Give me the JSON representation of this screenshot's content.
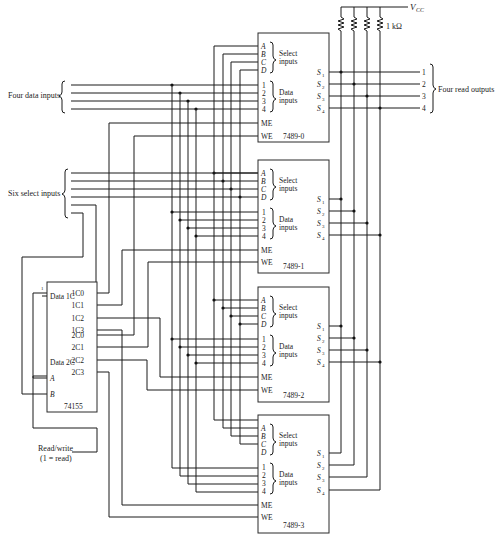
{
  "diagram": {
    "labels": {
      "data_inputs": "Four data inputs",
      "select_inputs": "Six select inputs",
      "read_outputs": "Four read outputs",
      "vcc": "V",
      "vcc_sub": "CC",
      "resistor": "1 kΩ",
      "rw_line1": "Read/write",
      "rw_line2": "(1 = read)"
    },
    "memory_chips": [
      {
        "name": "7489-0"
      },
      {
        "name": "7489-1"
      },
      {
        "name": "7489-2"
      },
      {
        "name": "7489-3"
      }
    ],
    "chip_pins": {
      "select": [
        "A",
        "B",
        "C",
        "D"
      ],
      "select_label_1": "Select",
      "select_label_2": "inputs",
      "data": [
        "1",
        "2",
        "3",
        "4"
      ],
      "data_label_1": "Data",
      "data_label_2": "inputs",
      "me": "ME",
      "we": "WE",
      "outputs": [
        "S",
        "S",
        "S",
        "S"
      ],
      "output_subs": [
        "1",
        "2",
        "3",
        "4"
      ]
    },
    "decoder": {
      "name": "74155",
      "data1c": "Data 1C",
      "data2c": "Data 2C",
      "a": "A",
      "b": "B",
      "tie_high": "1",
      "outputs_1": [
        "1C0",
        "1C1",
        "1C2",
        "1C3"
      ],
      "outputs_2": [
        "2C0",
        "2C1",
        "2C2",
        "2C3"
      ]
    },
    "output_numbers": [
      "1",
      "2",
      "3",
      "4"
    ]
  }
}
